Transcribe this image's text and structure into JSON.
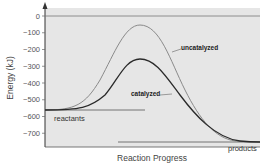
{
  "chart_data": {
    "type": "line",
    "title": "",
    "xlabel": "Reaction Progress",
    "ylabel": "Energy (kJ)",
    "ylim": [
      -780,
      30
    ],
    "yticks": [
      0,
      -100,
      -200,
      -300,
      -400,
      -500,
      -600,
      -700
    ],
    "ytick_labels": [
      "0",
      "−100",
      "−200",
      "−300",
      "−400",
      "−500",
      "−600",
      "−700"
    ],
    "grid": false,
    "background": "#e6e6e6",
    "series": [
      {
        "name": "uncatalyzed",
        "color": "#8a8a8a",
        "x": [
          0,
          0.1,
          0.2,
          0.3,
          0.4,
          0.45,
          0.5,
          0.6,
          0.7,
          0.8,
          0.9,
          1.0
        ],
        "values": [
          -560,
          -555,
          -480,
          -250,
          -70,
          -50,
          -70,
          -280,
          -560,
          -720,
          -750,
          -750
        ]
      },
      {
        "name": "catalyzed",
        "color": "#2a2a2a",
        "x": [
          0,
          0.1,
          0.2,
          0.3,
          0.4,
          0.45,
          0.5,
          0.6,
          0.7,
          0.8,
          0.9,
          1.0
        ],
        "values": [
          -560,
          -558,
          -520,
          -400,
          -280,
          -260,
          -280,
          -420,
          -600,
          -720,
          -750,
          -750
        ]
      }
    ],
    "annotations": [
      {
        "text": "reactants",
        "energy": -560
      },
      {
        "text": "products",
        "energy": -750
      },
      {
        "text": "uncatalyzed",
        "points_to": "uncatalyzed"
      },
      {
        "text": "catalyzed",
        "points_to": "catalyzed"
      }
    ],
    "reference_lines": [
      {
        "name": "zero-level",
        "energy": 0
      },
      {
        "name": "reactants-level",
        "energy": -560
      },
      {
        "name": "products-level",
        "energy": -750
      }
    ]
  }
}
